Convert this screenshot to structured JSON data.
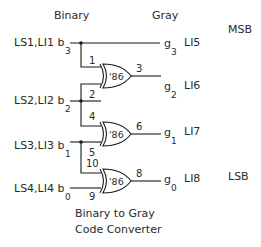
{
  "diagram": {
    "title_line1": "Binary to Gray",
    "title_line2": "Code Converter",
    "header_binary": "Binary",
    "header_gray": "Gray",
    "msb_label": "MSB",
    "lsb_label": "LSB",
    "inputs": [
      {
        "name": "LS1,LI1 b",
        "sub": "3"
      },
      {
        "name": "LS2,LI2 b",
        "sub": "2"
      },
      {
        "name": "LS3,LI3 b",
        "sub": "1"
      },
      {
        "name": "LS4,LI4 b",
        "sub": "0"
      }
    ],
    "outputs": [
      {
        "name": "g",
        "sub": "3",
        "tag": "LI5"
      },
      {
        "name": "g",
        "sub": "2",
        "tag": "LI6"
      },
      {
        "name": "g",
        "sub": "1",
        "tag": "LI7"
      },
      {
        "name": "g",
        "sub": "0",
        "tag": "LI8"
      }
    ],
    "gates": [
      {
        "part": "'86",
        "in_a": "1",
        "in_b": "2",
        "out": "3"
      },
      {
        "part": "'86",
        "in_a": "4",
        "in_b": "5",
        "out": "6"
      },
      {
        "part": "'86",
        "in_a": "10",
        "in_b": "9",
        "out": "8"
      }
    ],
    "colors": {
      "line": "#1a1a1a",
      "text": "#2a2a2a",
      "background": "#ffffff"
    }
  }
}
